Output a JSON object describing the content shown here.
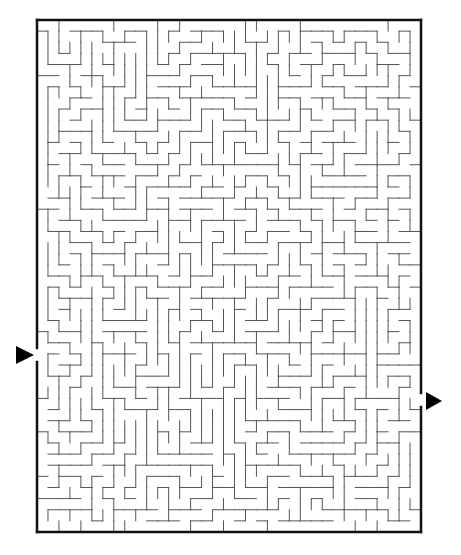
{
  "maze": {
    "border": {
      "x": 37,
      "y": 20,
      "width": 384,
      "height": 512,
      "color": "#111111",
      "stroke": 2.5
    },
    "wall_color": "#555555",
    "cell_size": 11,
    "cols": 35,
    "rows": 46,
    "entrance": {
      "side": "left",
      "y": 355,
      "gap": 14
    },
    "exit": {
      "side": "right",
      "y": 400,
      "gap": 14
    },
    "markers": {
      "start": {
        "x": 16,
        "y": 346,
        "w": 18,
        "h": 18,
        "direction": "right",
        "color": "#000000"
      },
      "end": {
        "x": 426,
        "y": 392,
        "w": 16,
        "h": 18,
        "direction": "right",
        "color": "#000000"
      }
    },
    "seed": 7321
  }
}
